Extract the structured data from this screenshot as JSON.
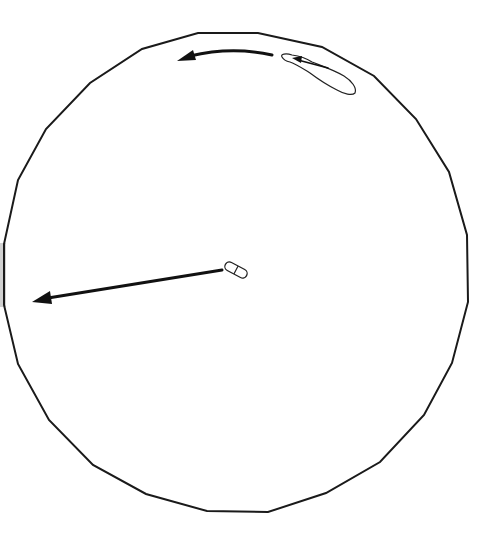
{
  "diagram": {
    "title": "",
    "colors": {
      "outline": "#1a1a1a",
      "arrow": "#111111",
      "edge_shade": "#bdbdbd",
      "background": "#ffffff"
    },
    "elements": [
      {
        "id": "arena",
        "kind": "polygon-circle",
        "sides": 24
      },
      {
        "id": "elongated-object",
        "kind": "outlined blob",
        "location": "upper-right inside arena"
      },
      {
        "id": "short-curved-arrow",
        "kind": "arrow",
        "direction": "leftward along arena edge"
      },
      {
        "id": "center-object",
        "kind": "double-pill shape",
        "location": "center"
      },
      {
        "id": "long-arrow",
        "kind": "arrow",
        "direction": "left toward arena edge"
      },
      {
        "id": "edge-shading",
        "kind": "gray strip",
        "location": "left edge"
      }
    ],
    "labels": []
  }
}
